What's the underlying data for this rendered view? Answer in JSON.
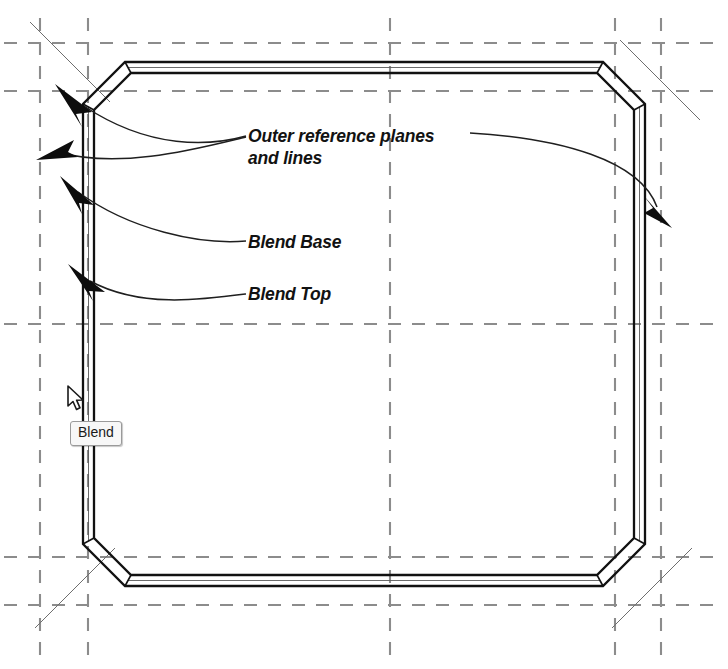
{
  "scene": {
    "kind": "cad-plan-view",
    "background": "#ffffff"
  },
  "annotations": {
    "outer_planes": "Outer reference planes\nand lines",
    "blend_base": "Blend Base",
    "blend_top": "Blend Top"
  },
  "tooltip": {
    "text": "Blend",
    "background": "#f7f7f7",
    "border_color": "#9a9a9a"
  },
  "cursor": {
    "type": "arrow-pointer",
    "x": 66,
    "y": 385
  },
  "colors": {
    "geometry_line": "#1a1a1a",
    "reference_plane": "#8c8c8c",
    "leader_line": "#1f1f1f",
    "construction_line": "#707070",
    "text": "#121212"
  },
  "geometry": {
    "description": "Chamfered rectangular blend solid drawn as double-line walls",
    "outer": {
      "left": 83,
      "top": 62,
      "right": 645,
      "bottom": 586,
      "chamfer": 42
    },
    "inner": {
      "left": 93,
      "top": 72,
      "right": 635,
      "bottom": 576,
      "chamfer": 42
    }
  },
  "reference_planes": {
    "vertical_x": [
      40,
      88,
      390,
      615,
      661
    ],
    "horizontal_y": [
      43,
      91,
      324,
      557,
      605
    ]
  },
  "leaders": [
    {
      "name": "outer-planes-corner",
      "arrow_x": 60,
      "arrow_y": 98,
      "target": "top-left-chamfer"
    },
    {
      "name": "outer-planes-left-wall",
      "arrow_x": 44,
      "arrow_y": 152,
      "target": "left-reference-plane"
    },
    {
      "name": "outer-planes-right-wall",
      "arrow_x": 658,
      "arrow_y": 215,
      "target": "right-reference-plane"
    },
    {
      "name": "blend-base",
      "arrow_x": 66,
      "arrow_y": 192,
      "target": "blend-base-edge"
    },
    {
      "name": "blend-top",
      "arrow_x": 76,
      "arrow_y": 277,
      "target": "blend-top-edge"
    }
  ]
}
